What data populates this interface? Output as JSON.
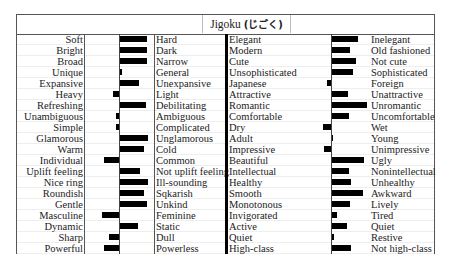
{
  "title": {
    "latin": "Jigoku",
    "kana": "(じごく)"
  },
  "chart_data": [
    {
      "type": "bar",
      "orientation": "horizontal-diverging",
      "title": "Jigoku (じごく) — panel 1",
      "left_labels": [
        "Soft",
        "Bright",
        "Broad",
        "Unique",
        "Expansive",
        "Heavy",
        "Refreshing",
        "Unambiguous",
        "Simple",
        "Glamorous",
        "Warm",
        "Individual",
        "Uplift feeling",
        "Nice ring",
        "Roundish",
        "Gentle",
        "Masculine",
        "Dynamic",
        "Sharp",
        "Powerful"
      ],
      "right_labels": [
        "Hard",
        "Dark",
        "Narrow",
        "General",
        "Unexpansive",
        "Light",
        "Debilitating",
        "Ambiguous",
        "Complicated",
        "Unglamorous",
        "Cold",
        "Common",
        "Not uplift feeling",
        "Ill-sounding",
        "Sqkarish",
        "Unkind",
        "Feminine",
        "Static",
        "Dull",
        "Powerless"
      ],
      "values": [
        4.0,
        4.0,
        4.0,
        0.4,
        2.8,
        -0.8,
        3.8,
        -0.5,
        -0.5,
        4.1,
        3.5,
        -2.2,
        3.0,
        4.1,
        3.5,
        4.0,
        -2.4,
        2.7,
        -1.4,
        -2.2
      ],
      "xlabel": "",
      "ylabel": "",
      "grid": true,
      "legend": "none"
    },
    {
      "type": "bar",
      "orientation": "horizontal-diverging",
      "title": "Jigoku (じごく) — panel 2",
      "left_labels": [
        "Elegant",
        "Modern",
        "Cute",
        "Unsophisticated",
        "Japanese",
        "Attractive",
        "Romantic",
        "Comfortable",
        "Dry",
        "Adult",
        "Impressive",
        "Beautiful",
        "Intellectual",
        "Healthy",
        "Smooth",
        "Monotonous",
        "Invigorated",
        "Active",
        "Quiet",
        "High-class"
      ],
      "right_labels": [
        "Inelegant",
        "Old fashioned",
        "Not cute",
        "Sophisticated",
        "Foreign",
        "Unattractive",
        "Unromantic",
        "Uncomfortable",
        "Wet",
        "Young",
        "Unimpressive",
        "Ugly",
        "Nonintellectual",
        "Unhealthy",
        "Awkward",
        "Lively",
        "Tired",
        "Quiet",
        "Restive",
        "Not high-class"
      ],
      "values": [
        3.9,
        2.7,
        3.5,
        3.1,
        -0.6,
        2.4,
        5.2,
        2.5,
        -1.2,
        0.3,
        -1.0,
        4.7,
        2.6,
        2.8,
        4.6,
        2.7,
        0.9,
        2.3,
        0.4,
        2.8
      ],
      "xlabel": "",
      "ylabel": "",
      "grid": true,
      "legend": "none"
    }
  ],
  "style": {
    "bar_color": "#000000",
    "border_color": "#555555",
    "grid_color": "#eeeeee"
  }
}
